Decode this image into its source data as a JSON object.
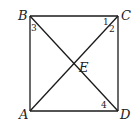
{
  "figure": {
    "type": "square-with-diagonals",
    "stroke_color": "#1a1a1a",
    "vertices": {
      "B": {
        "x": 30,
        "y": 16
      },
      "C": {
        "x": 118,
        "y": 16
      },
      "D": {
        "x": 118,
        "y": 111
      },
      "A": {
        "x": 30,
        "y": 111
      },
      "E": {
        "x": 74,
        "y": 64
      }
    },
    "labels": {
      "A": "A",
      "B": "B",
      "C": "C",
      "D": "D",
      "E": "E"
    },
    "angle_labels": {
      "a1": "1",
      "a2": "2",
      "a3": "3",
      "a4": "4"
    },
    "segments": [
      "AB",
      "BC",
      "CD",
      "DA",
      "AC",
      "BD"
    ]
  }
}
